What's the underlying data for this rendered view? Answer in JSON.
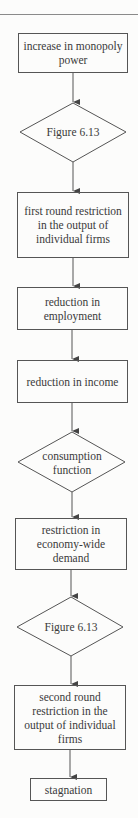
{
  "flowchart": {
    "nodes": [
      {
        "id": "n1",
        "shape": "box",
        "label": "increase in monopoly power"
      },
      {
        "id": "n2",
        "shape": "diamond",
        "label": "Figure 6.13"
      },
      {
        "id": "n3",
        "shape": "box",
        "label": "first round restriction in the output of individual firms"
      },
      {
        "id": "n4",
        "shape": "box",
        "label": "reduction in employment"
      },
      {
        "id": "n5",
        "shape": "box",
        "label": "reduction in income"
      },
      {
        "id": "n6",
        "shape": "diamond",
        "label": "consumption function"
      },
      {
        "id": "n7",
        "shape": "box",
        "label": "restriction in economy-wide demand"
      },
      {
        "id": "n8",
        "shape": "diamond",
        "label": "Figure 6.13"
      },
      {
        "id": "n9",
        "shape": "box",
        "label": "second round restriction in the output of individual firms"
      },
      {
        "id": "n10",
        "shape": "box",
        "label": "stagnation"
      }
    ],
    "edges": [
      [
        "n1",
        "n2"
      ],
      [
        "n2",
        "n3"
      ],
      [
        "n3",
        "n4"
      ],
      [
        "n4",
        "n5"
      ],
      [
        "n5",
        "n6"
      ],
      [
        "n6",
        "n7"
      ],
      [
        "n7",
        "n8"
      ],
      [
        "n8",
        "n9"
      ],
      [
        "n9",
        "n10"
      ]
    ],
    "colors": {
      "line": "#555555",
      "background": "#fcfcfb",
      "text": "#3a3a3a"
    }
  }
}
